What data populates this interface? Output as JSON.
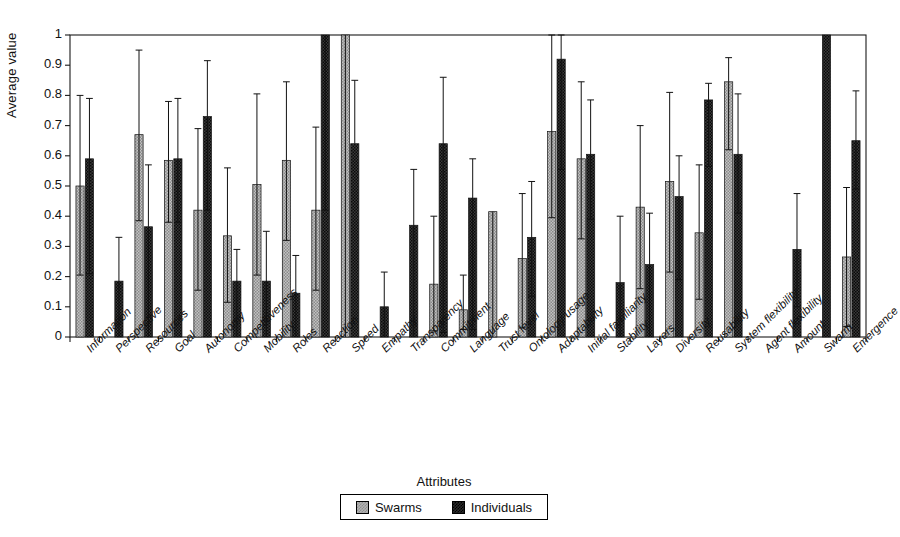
{
  "chart_data": {
    "type": "bar",
    "title": "",
    "subtitle": "",
    "xlabel": "Attributes",
    "ylabel": "Average value",
    "ylim": [
      0,
      1
    ],
    "ytick_labels": [
      "0",
      "0.1",
      "0.2",
      "0.3",
      "0.4",
      "0.5",
      "0.6",
      "0.7",
      "0.8",
      "0.9",
      "1"
    ],
    "ytick_values": [
      0,
      0.1,
      0.2,
      0.3,
      0.4,
      0.5,
      0.6,
      0.7,
      0.8,
      0.9,
      1
    ],
    "grid": false,
    "legend_position": "bottom-center",
    "error_bars": "asymmetric (min/max whiskers)",
    "categories": [
      "Information",
      "Perspective",
      "Resources",
      "Goal",
      "Autonomy",
      "Competitiveness",
      "Mobility",
      "Roles",
      "Reaction",
      "Speed",
      "Empathy",
      "Transparency",
      "Commitment",
      "Language",
      "Trust level",
      "Ontology usage",
      "Adaptability",
      "Initial familiarity",
      "Stability",
      "Layers",
      "Diversity",
      "Reusability",
      "System flexibility",
      "Agent flexibility",
      "Amount",
      "Swarm",
      "Emergence"
    ],
    "series": [
      {
        "name": "Swarms",
        "color": "#b3b3b3",
        "values": [
          0.5,
          null,
          0.67,
          0.585,
          0.42,
          0.335,
          0.505,
          0.585,
          0.42,
          1.0,
          null,
          null,
          0.175,
          0.09,
          0.415,
          0.26,
          0.68,
          0.59,
          null,
          0.43,
          0.515,
          0.345,
          0.845,
          null,
          null,
          null,
          0.265
        ],
        "err_low": [
          0.205,
          null,
          0.385,
          0.38,
          0.155,
          0.115,
          0.205,
          0.32,
          0.155,
          0.0,
          null,
          null,
          0.02,
          0.025,
          0.0,
          0.03,
          0.395,
          0.325,
          null,
          0.16,
          0.215,
          0.125,
          0.62,
          null,
          null,
          null,
          0.035
        ],
        "err_high": [
          0.8,
          null,
          0.95,
          0.78,
          0.69,
          0.56,
          0.805,
          0.845,
          0.695,
          1.0,
          null,
          null,
          0.4,
          0.205,
          0.0,
          0.475,
          1.0,
          0.845,
          null,
          0.7,
          0.81,
          0.57,
          0.925,
          null,
          null,
          null,
          0.495
        ]
      },
      {
        "name": "Individuals",
        "color": "#2b2b2b",
        "values": [
          0.59,
          0.185,
          0.365,
          0.59,
          0.73,
          0.185,
          0.185,
          0.145,
          1.0,
          0.64,
          0.1,
          0.37,
          0.64,
          0.46,
          null,
          0.33,
          0.92,
          0.605,
          0.18,
          0.24,
          0.465,
          0.785,
          0.605,
          null,
          0.29,
          1.0,
          0.65
        ],
        "err_low": [
          0.21,
          0.0,
          0.0,
          0.38,
          0.42,
          0.0,
          0.0,
          0.0,
          0.42,
          0.64,
          0.0,
          0.0,
          0.015,
          0.025,
          null,
          0.135,
          0.555,
          0.39,
          0.0,
          0.0,
          0.19,
          0.565,
          0.41,
          null,
          0.1,
          1.0,
          0.49
        ],
        "err_high": [
          0.79,
          0.33,
          0.57,
          0.79,
          0.915,
          0.29,
          0.35,
          0.27,
          1.0,
          0.85,
          0.215,
          0.555,
          0.86,
          0.59,
          null,
          0.515,
          1.0,
          0.785,
          0.4,
          0.41,
          0.6,
          0.84,
          0.805,
          null,
          0.475,
          1.0,
          0.815
        ]
      }
    ]
  },
  "legend": {
    "items": [
      {
        "label": "Swarms",
        "swatch": "swatch-swarms"
      },
      {
        "label": "Individuals",
        "swatch": "swatch-individuals"
      }
    ]
  },
  "axes": {
    "y_title": "Average value",
    "x_title": "Attributes"
  }
}
